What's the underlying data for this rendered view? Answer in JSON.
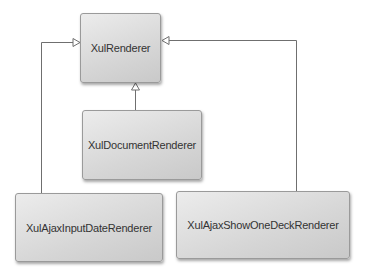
{
  "diagram": {
    "type": "uml-class-inheritance",
    "nodes": [
      {
        "id": "xulrenderer",
        "label": "XulRenderer"
      },
      {
        "id": "xuldocumentrenderer",
        "label": "XulDocumentRenderer"
      },
      {
        "id": "xulajaxinputdaterenderer",
        "label": "XulAjaxInputDateRenderer"
      },
      {
        "id": "xulajaxshowonedeckrenderer",
        "label": "XulAjaxShowOneDeckRenderer"
      }
    ],
    "edges": [
      {
        "from": "xuldocumentrenderer",
        "to": "xulrenderer",
        "kind": "generalization"
      },
      {
        "from": "xulajaxinputdaterenderer",
        "to": "xulrenderer",
        "kind": "generalization"
      },
      {
        "from": "xulajaxshowonedeckrenderer",
        "to": "xulrenderer",
        "kind": "generalization"
      }
    ],
    "colors": {
      "line": "#6f6f6f",
      "box_border": "#9a9a9a",
      "text": "#333333"
    }
  }
}
